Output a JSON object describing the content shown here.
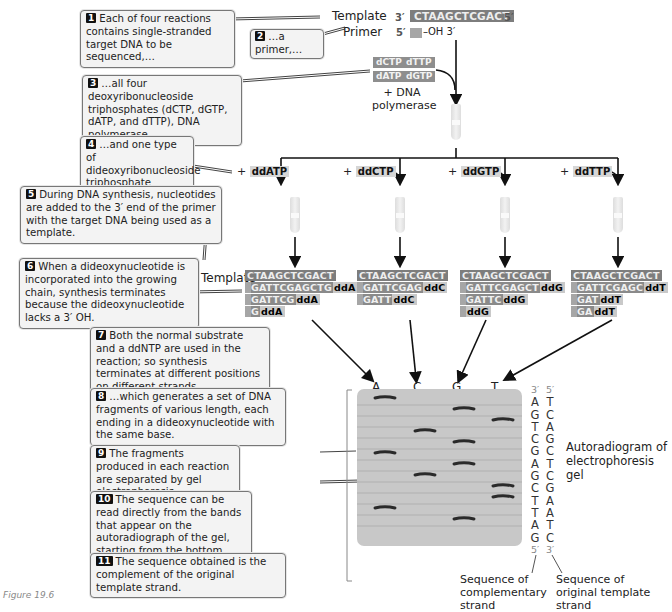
{
  "steps": [
    {
      "n": "1",
      "text": "Each of four reactions contains single-stranded target DNA to be sequenced,…"
    },
    {
      "n": "2",
      "text": "…a primer,…"
    },
    {
      "n": "3",
      "text": "…all four deoxyribonucleoside triphosphates (dCTP, dGTP, dATP, and dTTP), DNA polymerase,…"
    },
    {
      "n": "4",
      "text": "…and one type of dideoxyribonucleoside triphosphate (ddNTP)."
    },
    {
      "n": "5",
      "text": "During DNA synthesis, nucleotides are added to the 3′ end of the primer with the target DNA being used as a template."
    },
    {
      "n": "6",
      "text": "When a dideoxynucleotide is incorporated into the growing chain, synthesis terminates because the dideoxynucleotide lacks a 3′ OH."
    },
    {
      "n": "7",
      "text": "Both the normal substrate and a ddNTP are used in the reaction; so synthesis terminates at different positions on different strands,…"
    },
    {
      "n": "8",
      "text": "…which generates a set of DNA fragments of various length, each ending in a dideoxynucleotide with the same base."
    },
    {
      "n": "9",
      "text": "The fragments produced in each reaction are separated by gel electrophoresis."
    },
    {
      "n": "10",
      "text": "The sequence can be read directly from the bands that appear on the autoradiograph of the gel, starting from the bottom."
    },
    {
      "n": "11",
      "text": "The sequence obtained is the complement of the original template strand."
    }
  ],
  "top": {
    "template_label": "Template",
    "primer_label": "Primer",
    "template_3": "3′",
    "template_seq": "CTAAGCTCGACT",
    "template_5": "5′",
    "primer_5": "5′",
    "primer_oh": "–OH 3′",
    "dntps": [
      "dCTP",
      "dTTP",
      "dATP",
      "dGTP"
    ],
    "polymerase": "+ DNA polymerase"
  },
  "reactions": [
    {
      "plus": "+",
      "dd": "ddATP",
      "strands": [
        {
          "grow": "GATTCGAGCTG",
          "end": "ddA"
        },
        {
          "grow": "GATTCG",
          "end": "ddA"
        },
        {
          "grow": "G",
          "end": "ddA"
        }
      ]
    },
    {
      "plus": "+",
      "dd": "ddCTP",
      "strands": [
        {
          "grow": "GATTCGAG",
          "end": "ddC"
        },
        {
          "grow": "GATT",
          "end": "ddC"
        }
      ]
    },
    {
      "plus": "+",
      "dd": "ddGTP",
      "strands": [
        {
          "grow": "GATTCGAGCT",
          "end": "ddG"
        },
        {
          "grow": "GATTC",
          "end": "ddG"
        },
        {
          "grow": "",
          "end": "ddG"
        }
      ]
    },
    {
      "plus": "+",
      "dd": "ddTTP",
      "strands": [
        {
          "grow": "GATTCGAGC",
          "end": "ddT"
        },
        {
          "grow": "GAT",
          "end": "ddT"
        },
        {
          "grow": "GA",
          "end": "ddT"
        }
      ]
    }
  ],
  "template_row_label": "Template",
  "template_row_seq": "CTAAGCTCGACT",
  "gel": {
    "lanes": [
      "A",
      "C",
      "G",
      "T"
    ],
    "bands_top_to_bottom": [
      "A",
      "G",
      "T",
      "C",
      "G",
      "A",
      "G",
      "C",
      "T",
      "T",
      "A",
      "G"
    ]
  },
  "sequence": {
    "complementary": {
      "top": "3′",
      "bases": [
        "A",
        "G",
        "T",
        "C",
        "G",
        "A",
        "G",
        "C",
        "T",
        "T",
        "A",
        "G"
      ],
      "bottom": "5′"
    },
    "original": {
      "top": "5′",
      "bases": [
        "T",
        "C",
        "A",
        "G",
        "C",
        "T",
        "C",
        "G",
        "A",
        "A",
        "T",
        "C"
      ],
      "bottom": "3′"
    },
    "label_complementary": "Sequence of complementary strand",
    "label_original": "Sequence of original template strand"
  },
  "autoradiogram_label": "Autoradiogram of electrophoresis gel",
  "figure_number": "Figure 19.6"
}
